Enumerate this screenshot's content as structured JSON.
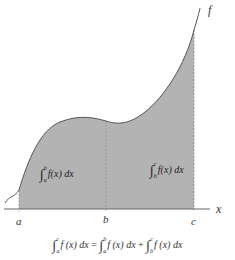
{
  "diagram": {
    "curve_label": "f",
    "axis_label": "x",
    "points": [
      {
        "id": "a",
        "label": "a"
      },
      {
        "id": "b",
        "label": "b"
      },
      {
        "id": "c",
        "label": "c"
      }
    ],
    "regions": [
      {
        "id": "left",
        "lower": "a",
        "upper": "b",
        "expr": "f(x) dx"
      },
      {
        "id": "right",
        "lower": "b",
        "upper": "c",
        "expr": "f(x) dx"
      }
    ],
    "formula": {
      "lhs": {
        "lower": "a",
        "upper": "c",
        "expr": "f (x) dx"
      },
      "equals": "=",
      "rhs1": {
        "lower": "a",
        "upper": "b",
        "expr": "f (x) dx"
      },
      "plus": "+",
      "rhs2": {
        "lower": "b",
        "upper": "c",
        "expr": "f (x) dx"
      }
    },
    "colors": {
      "fill": "#b3b3b3",
      "curve": "#555555",
      "axis": "#666666",
      "divider": "#8a8a8a"
    }
  }
}
